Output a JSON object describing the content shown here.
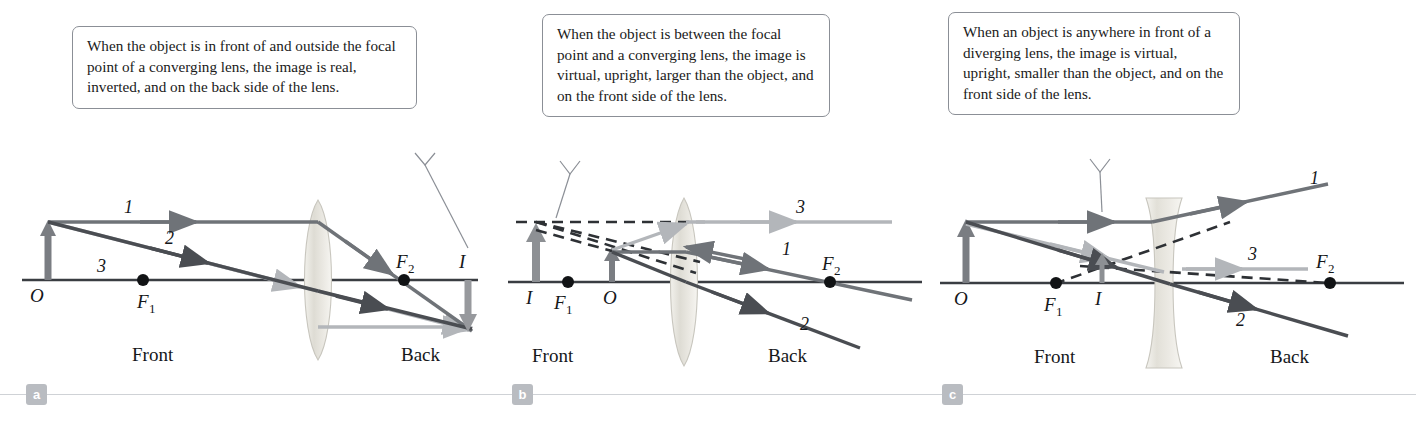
{
  "figure": {
    "panels": [
      {
        "tag": "a",
        "callout": "When the object is in front of and outside the focal point of a converging lens, the image is real, inverted, and on the back side of the lens.",
        "lens_type": "converging",
        "side_labels": {
          "front": "Front",
          "back": "Back"
        },
        "points": [
          {
            "id": "O",
            "label": "O"
          },
          {
            "id": "F1",
            "label": "F",
            "sub": "1"
          },
          {
            "id": "F2",
            "label": "F",
            "sub": "2"
          },
          {
            "id": "I",
            "label": "I"
          }
        ],
        "ray_labels": [
          "1",
          "2",
          "3"
        ],
        "object": {
          "label": "O",
          "direction": "up",
          "size": "normal"
        },
        "image": {
          "label": "I",
          "direction": "down",
          "nature": "real, inverted"
        }
      },
      {
        "tag": "b",
        "callout": "When the object is between the focal point and a converging lens, the image is virtual, upright, larger than the object, and on the front side of the lens.",
        "lens_type": "converging",
        "side_labels": {
          "front": "Front",
          "back": "Back"
        },
        "points": [
          {
            "id": "I",
            "label": "I"
          },
          {
            "id": "F1",
            "label": "F",
            "sub": "1"
          },
          {
            "id": "O",
            "label": "O"
          },
          {
            "id": "F2",
            "label": "F",
            "sub": "2"
          }
        ],
        "ray_labels": [
          "1",
          "2",
          "3"
        ],
        "object": {
          "label": "O",
          "direction": "up",
          "size": "small"
        },
        "image": {
          "label": "I",
          "direction": "up",
          "nature": "virtual, upright, larger"
        }
      },
      {
        "tag": "c",
        "callout": "When an object is anywhere in front of a diverging lens, the image is virtual, upright, smaller than the object, and on the front side of the lens.",
        "lens_type": "diverging",
        "side_labels": {
          "front": "Front",
          "back": "Back"
        },
        "points": [
          {
            "id": "O",
            "label": "O"
          },
          {
            "id": "F1",
            "label": "F",
            "sub": "1"
          },
          {
            "id": "I",
            "label": "I"
          },
          {
            "id": "F2",
            "label": "F",
            "sub": "2"
          }
        ],
        "ray_labels": [
          "1",
          "2",
          "3"
        ],
        "object": {
          "label": "O",
          "direction": "up",
          "size": "normal"
        },
        "image": {
          "label": "I",
          "direction": "up",
          "nature": "virtual, upright, smaller"
        }
      }
    ],
    "colors": {
      "ray1": "#6f7378",
      "ray2": "#4a4d52",
      "ray3": "#b3b6ba",
      "axis": "#3a3d42",
      "object_arrow": "#7a7d82",
      "lens_fill": "#e3e1da",
      "callout_border": "#8b8f96",
      "tag_box": "#b9bcc1",
      "rule": "#cfd2d6"
    }
  }
}
